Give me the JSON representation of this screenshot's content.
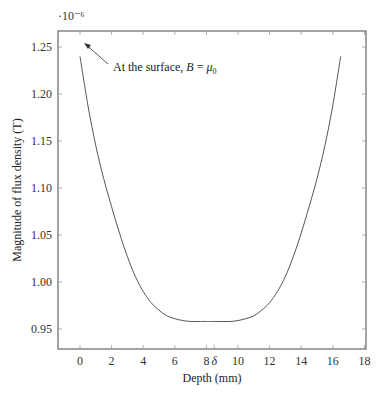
{
  "chart_data": {
    "type": "line",
    "title": "",
    "xlabel": "Depth (mm)",
    "ylabel": "Magnitude of flux density (T)",
    "y_scale_multiplier": "·10⁻⁶",
    "xlim": [
      -1.4,
      18
    ],
    "ylim": [
      0.932,
      1.267
    ],
    "x_ticks": [
      0,
      2,
      4,
      6,
      8,
      10,
      12,
      14,
      16,
      18
    ],
    "x_tick_labels": [
      "0",
      "2",
      "4",
      "6",
      "8",
      "10",
      "12",
      "14",
      "16",
      "18"
    ],
    "extra_x_tick": {
      "value": 8.5,
      "label": "δ"
    },
    "y_ticks": [
      0.95,
      1.0,
      1.05,
      1.1,
      1.15,
      1.2,
      1.25
    ],
    "y_tick_labels": [
      "0.95",
      "1.00",
      "1.05",
      "1.10",
      "1.15",
      "1.20",
      "1.25"
    ],
    "grid": false,
    "legend": null,
    "annotation": {
      "text_prefix": "At the surface, ",
      "text_var": "B",
      "text_eq": " = ",
      "text_mu": "μ",
      "text_sub": "0",
      "arrow_from": [
        2.3,
        1.232
      ],
      "arrow_to": [
        0.15,
        1.254
      ]
    },
    "series": [
      {
        "name": "B(depth)",
        "color": "#555555",
        "x": [
          0,
          0.5,
          1,
          1.5,
          2,
          2.5,
          3,
          3.5,
          4,
          4.5,
          5,
          5.5,
          6,
          6.5,
          7,
          7.5,
          8,
          8.25,
          8.5,
          9,
          9.5,
          10,
          10.5,
          11,
          11.5,
          12,
          12.5,
          13,
          13.5,
          14,
          14.5,
          15,
          15.5,
          16,
          16.5
        ],
        "y": [
          1.24,
          1.188,
          1.145,
          1.11,
          1.08,
          1.052,
          1.027,
          1.006,
          0.99,
          0.978,
          0.97,
          0.964,
          0.961,
          0.959,
          0.958,
          0.958,
          0.958,
          0.958,
          0.958,
          0.958,
          0.958,
          0.959,
          0.961,
          0.964,
          0.97,
          0.978,
          0.99,
          1.006,
          1.027,
          1.052,
          1.08,
          1.11,
          1.145,
          1.188,
          1.24
        ]
      }
    ]
  }
}
